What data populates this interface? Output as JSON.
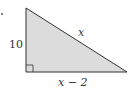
{
  "diagram": {
    "type": "right-triangle",
    "labels": {
      "vertical_leg": "10",
      "hypotenuse": "x",
      "base": "x − 2"
    },
    "colors": {
      "fill": "#dcdcdc",
      "stroke": "#333333"
    },
    "right_angle_marker": true
  }
}
